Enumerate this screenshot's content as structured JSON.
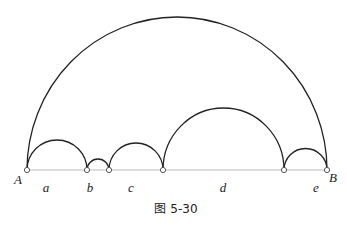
{
  "figure": {
    "caption": "图 5-30",
    "baseline_y": 170,
    "points": [
      {
        "name": "A",
        "x": 27
      },
      {
        "name": "p1",
        "x": 87
      },
      {
        "name": "p2",
        "x": 109
      },
      {
        "name": "p3",
        "x": 163
      },
      {
        "name": "p4",
        "x": 284
      },
      {
        "name": "B",
        "x": 327
      }
    ],
    "endpoint_labels": {
      "left": "A",
      "right": "B"
    },
    "segment_labels": [
      "a",
      "b",
      "c",
      "d",
      "e"
    ],
    "arc_color": "#222222",
    "baseline_color": "#bbbbbb"
  }
}
